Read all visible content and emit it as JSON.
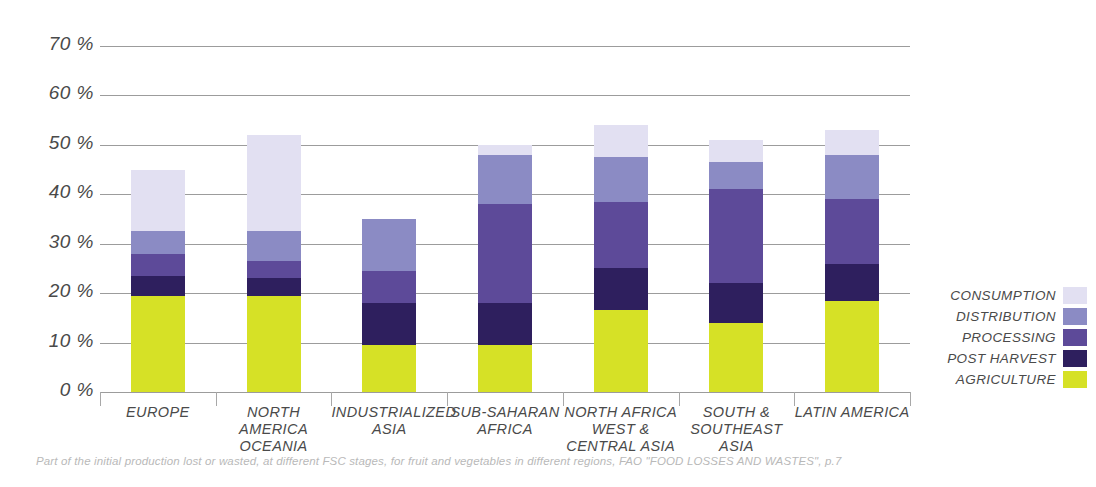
{
  "chart_data": {
    "type": "bar",
    "title": "",
    "subtitle": "",
    "stacked": true,
    "xlabel": "",
    "ylabel": "",
    "ylim": [
      0,
      70
    ],
    "ytick_step": 10,
    "ytick_labels": [
      "70 %",
      "60 %",
      "50 %",
      "40 %",
      "30 %",
      "20 %",
      "10 %",
      "0 %"
    ],
    "ytick_values": [
      70,
      60,
      50,
      40,
      30,
      20,
      10,
      0
    ],
    "grid": true,
    "legend_position": "right",
    "categories": [
      "EUROPE",
      "NORTH AMERICA\nOCEANIA",
      "INDUSTRIALIZED\nASIA",
      "SUB-SAHARAN\nAFRICA",
      "NORTH AFRICA\nWEST &\nCENTRAL ASIA",
      "SOUTH &\nSOUTHEAST\nASIA",
      "LATIN AMERICA"
    ],
    "series": [
      {
        "name": "AGRICULTURE",
        "color": "#d6e126",
        "values": [
          19.5,
          19.5,
          9.5,
          9.5,
          16.5,
          14.0,
          18.5
        ]
      },
      {
        "name": "POST HARVEST",
        "color": "#2e1f5e",
        "values": [
          4.0,
          3.5,
          8.5,
          8.5,
          8.5,
          8.0,
          7.5
        ]
      },
      {
        "name": "PROCESSING",
        "color": "#5d4a99",
        "values": [
          4.5,
          3.5,
          6.5,
          20.0,
          13.5,
          19.0,
          13.0
        ]
      },
      {
        "name": "DISTRIBUTION",
        "color": "#8b8bc4",
        "values": [
          4.5,
          6.0,
          10.5,
          10.0,
          9.0,
          5.5,
          9.0
        ]
      },
      {
        "name": "CONSUMPTION",
        "color": "#e2e0f2",
        "values": [
          12.5,
          19.5,
          0.0,
          2.0,
          6.5,
          4.5,
          5.0
        ]
      }
    ],
    "totals": [
      45.0,
      52.0,
      35.0,
      50.0,
      54.0,
      51.0,
      53.0
    ],
    "legend_entries": [
      {
        "label": "CONSUMPTION",
        "color": "#e2e0f2"
      },
      {
        "label": "DISTRIBUTION",
        "color": "#8b8bc4"
      },
      {
        "label": "PROCESSING",
        "color": "#5d4a99"
      },
      {
        "label": "POST HARVEST",
        "color": "#2e1f5e"
      },
      {
        "label": "AGRICULTURE",
        "color": "#d6e126"
      }
    ],
    "caption": "Part of the initial production lost or wasted, at different FSC stages, for fruit and vegetables in different regions, FAO \"FOOD LOSSES AND WASTES\", p.7"
  }
}
